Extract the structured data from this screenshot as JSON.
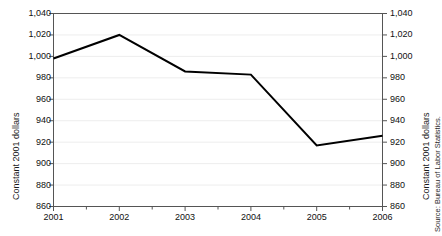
{
  "chart_data": {
    "type": "line",
    "title": "",
    "xlabel": "",
    "ylabel": "Constant 2001 dollars",
    "ylabel_right": "Constant 2001 dollars",
    "source": "Source: Bureau of Labor Statistics.",
    "categories": [
      "2001",
      "2002",
      "2003",
      "2004",
      "2005",
      "2006"
    ],
    "x": [
      2001,
      2002,
      2003,
      2004,
      2005,
      2006
    ],
    "values": [
      998,
      1020,
      986,
      983,
      917,
      926
    ],
    "series": [
      {
        "name": "Constant 2001 dollars",
        "values": [
          998,
          1020,
          986,
          983,
          917,
          926
        ],
        "color": "#000000"
      }
    ],
    "ylim": [
      860,
      1040
    ],
    "xlim": [
      2001,
      2006
    ],
    "ytick_values": [
      860,
      880,
      900,
      920,
      940,
      960,
      980,
      1000,
      1020,
      1040
    ],
    "ytick_labels": [
      "860",
      "880",
      "900",
      "920",
      "940",
      "960",
      "980",
      "1,000",
      "1,020",
      "1,040"
    ],
    "ytick_labels_right": [
      "860",
      "880",
      "900",
      "920",
      "940",
      "960",
      "980",
      "1,000",
      "1,020",
      "1,040"
    ],
    "xtick_labels": [
      "2001",
      "2002",
      "2003",
      "2004",
      "2005",
      "2006"
    ],
    "grid": true,
    "grid_axis": "y",
    "grid_color": "#ededed",
    "legend": false,
    "legend_position": "none",
    "line_color": "#000000",
    "line_width": 2,
    "frame_color": "#555555",
    "background": "#ffffff"
  }
}
